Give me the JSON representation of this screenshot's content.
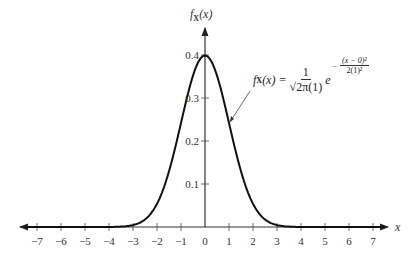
{
  "chart_data": {
    "type": "line",
    "title": "",
    "xlabel": "x",
    "ylabel": "f_X(x)",
    "xlim": [
      -7.5,
      7.5
    ],
    "ylim": [
      0,
      0.45
    ],
    "grid": false,
    "legend": null,
    "x_ticks": [
      -7,
      -6,
      -5,
      -4,
      -3,
      -2,
      -1,
      0,
      1,
      2,
      3,
      4,
      5,
      6,
      7
    ],
    "x_tick_labels": [
      "−7",
      "−6",
      "−5",
      "−4",
      "−3",
      "−2",
      "−1",
      "0",
      "1",
      "2",
      "3",
      "4",
      "5",
      "6",
      "7"
    ],
    "y_ticks": [
      0.1,
      0.2,
      0.3,
      0.4
    ],
    "y_tick_labels": [
      "0.1",
      "0.2",
      "0.3",
      "0.4"
    ],
    "series": [
      {
        "name": "Standard normal PDF (mean 0, sd 1)",
        "x": [
          -7,
          -6,
          -5,
          -4,
          -3,
          -2.5,
          -2,
          -1.5,
          -1,
          -0.5,
          0,
          0.5,
          1,
          1.5,
          2,
          2.5,
          3,
          4,
          5,
          6,
          7
        ],
        "values": [
          0.0,
          0.0,
          0.0,
          0.0001,
          0.0044,
          0.0175,
          0.054,
          0.1295,
          0.242,
          0.3521,
          0.3989,
          0.3521,
          0.242,
          0.1295,
          0.054,
          0.0175,
          0.0044,
          0.0001,
          0.0,
          0.0,
          0.0
        ]
      }
    ],
    "annotations": [
      {
        "text": "f_X(x) = 1/(√(2π)(1)) e^(−(x−0)^2 / 2(1)^2)",
        "points_to": {
          "x": 1.0,
          "y": 0.242
        }
      }
    ]
  },
  "labels": {
    "y_axis": "f",
    "y_axis_sub": "X",
    "y_axis_arg": "(x)",
    "x_axis": "x",
    "formula": {
      "lhs_f": "f",
      "lhs_sub": "X",
      "lhs_arg": "(x) =",
      "num": "1",
      "den": "√2π(1)",
      "e": "e",
      "exp_sign": "−",
      "exp_num": "(x − 0)²",
      "exp_den": "2(1)²"
    }
  }
}
